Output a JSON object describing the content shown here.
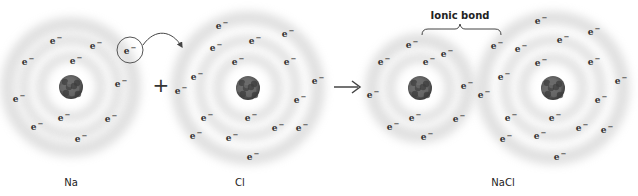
{
  "diagram": {
    "type": "ionic-bond-formation",
    "operator_plus": "+",
    "operator_arrow": "→",
    "bond_label": "Ionic bond",
    "electron_symbol": "e",
    "electron_charge": "−",
    "colors": {
      "ring": "#c8c8c8",
      "nucleus": "#6a6a6a",
      "nucleus_dark": "#3e3e3e",
      "text": "#222222",
      "line": "#444444"
    }
  },
  "atoms": [
    {
      "id": "na",
      "label": "Na",
      "center": [
        71,
        87
      ],
      "rings": [
        30,
        47,
        63
      ],
      "label_pos": [
        71,
        182
      ],
      "electrons": [
        [
          56,
          40
        ],
        [
          96,
          45
        ],
        [
          28,
          61
        ],
        [
          76,
          60
        ],
        [
          121,
          83
        ],
        [
          19,
          98
        ],
        [
          64,
          117
        ],
        [
          111,
          118
        ],
        [
          37,
          126
        ],
        [
          81,
          138
        ]
      ],
      "transferring_electron": [
        130,
        50
      ]
    },
    {
      "id": "cl",
      "label": "Cl",
      "center": [
        248,
        88
      ],
      "rings": [
        30,
        48,
        70
      ],
      "label_pos": [
        240,
        182
      ],
      "electrons": [
        [
          222,
          25
        ],
        [
          255,
          40
        ],
        [
          288,
          33
        ],
        [
          216,
          47
        ],
        [
          238,
          61
        ],
        [
          290,
          61
        ],
        [
          197,
          76
        ],
        [
          181,
          90
        ],
        [
          318,
          80
        ],
        [
          300,
          99
        ],
        [
          207,
          117
        ],
        [
          251,
          117
        ],
        [
          278,
          127
        ],
        [
          302,
          127
        ],
        [
          196,
          135
        ],
        [
          232,
          137
        ],
        [
          253,
          156
        ]
      ]
    },
    {
      "id": "na-ion",
      "label": "",
      "center": [
        420,
        88
      ],
      "rings": [
        30,
        48
      ],
      "electrons": [
        [
          412,
          44
        ],
        [
          384,
          61
        ],
        [
          429,
          61
        ],
        [
          447,
          53
        ],
        [
          373,
          94
        ],
        [
          467,
          85
        ],
        [
          415,
          117
        ],
        [
          393,
          126
        ],
        [
          459,
          118
        ],
        [
          427,
          136
        ]
      ]
    },
    {
      "id": "cl-ion",
      "label": "",
      "center": [
        553,
        88
      ],
      "rings": [
        30,
        48,
        70
      ],
      "electrons": [
        [
          484,
          94
        ],
        [
          541,
          20
        ],
        [
          497,
          45
        ],
        [
          521,
          48
        ],
        [
          563,
          39
        ],
        [
          594,
          31
        ],
        [
          541,
          62
        ],
        [
          594,
          61
        ],
        [
          504,
          76
        ],
        [
          621,
          80
        ],
        [
          601,
          99
        ],
        [
          511,
          117
        ],
        [
          555,
          117
        ],
        [
          582,
          127
        ],
        [
          607,
          129
        ],
        [
          506,
          138
        ],
        [
          540,
          135
        ],
        [
          560,
          156
        ]
      ]
    }
  ],
  "product": {
    "label": "NaCl",
    "label_pos": [
      503,
      182
    ]
  }
}
